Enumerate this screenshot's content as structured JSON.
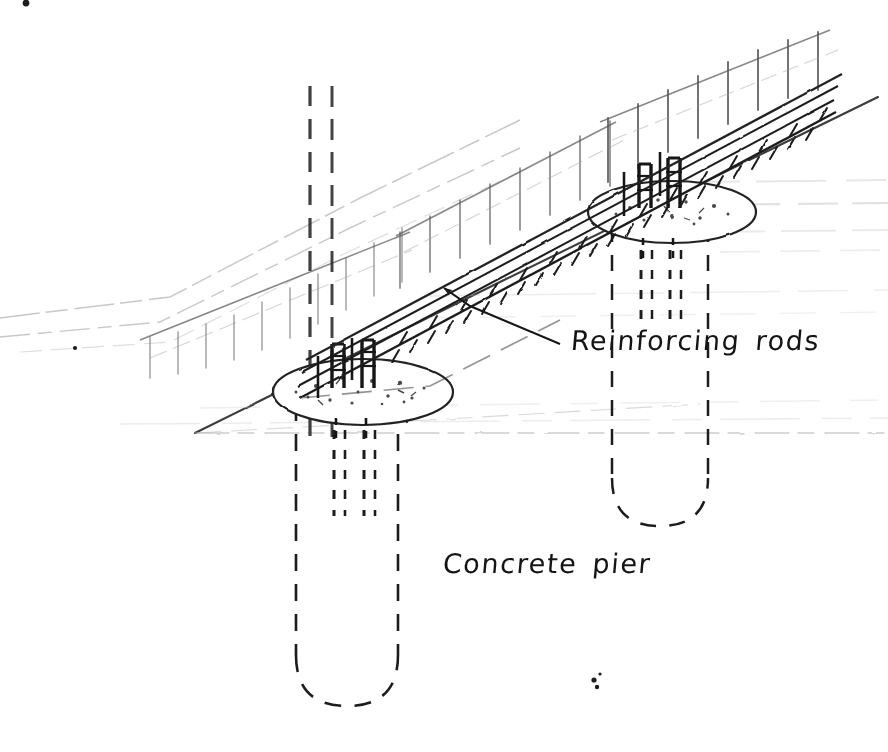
{
  "sheet": {
    "title": "Concrete pier foundation with reinforcing rods — hand drawn sketch",
    "width": 888,
    "height": 752,
    "background_color": "#ffffff",
    "ink_color": "#1a1a1a",
    "faded_ink_color": "#8f8f8f"
  },
  "annotations": {
    "reinforcing_rods": {
      "text": "Reinforcing rods",
      "leader": "line from label left edge up-left to beam, arrowhead at beam"
    },
    "concrete_pier": {
      "text": "Concrete pier",
      "leader": "horizontal dashed line from label left to pier wall, arrowhead at pier"
    }
  },
  "drawing": {
    "ground_plane": {
      "name": "sloping-ground-plane",
      "description": "wedge shaped ground surface rising to the upper right, drawn with faded double edge lines and hanging slope tick marks",
      "apex_point": [
        193,
        433
      ],
      "upper_edge_start": [
        193,
        433
      ],
      "upper_edge_end": [
        880,
        95
      ]
    },
    "slope_hatch": {
      "name": "slope-hatch-ticks",
      "description": "short vertical teeth hanging below each slope edge line",
      "rows": 3,
      "ticks_per_row": 12
    },
    "beam": {
      "name": "reinforced-concrete-beam",
      "description": "diagonal reinforced concrete grade beam spanning both piers",
      "start": [
        300,
        392
      ],
      "end": [
        830,
        108
      ],
      "band_count": 4,
      "hatched": true
    },
    "piers": [
      {
        "name": "left-concrete-pier",
        "cap_center": [
          363,
          392
        ],
        "cap_rx": 90,
        "cap_ry": 33,
        "shaft_top_y": 410,
        "shaft_bottom_y": 700,
        "shaft_half_width": 68,
        "hidden": true,
        "rod_count": 2
      },
      {
        "name": "right-concrete-pier",
        "cap_center": [
          672,
          212
        ],
        "cap_rx": 84,
        "cap_ry": 31,
        "shaft_top_y": 228,
        "shaft_bottom_y": 520,
        "shaft_half_width": 62,
        "hidden": true,
        "rod_count": 2
      }
    ],
    "rods": {
      "name": "reinforcing-rods",
      "description": "vertical steel rods running up out of each pier into the beam, shown dashed where hidden inside the pier",
      "left_pier_rod_x": [
        334,
        366
      ],
      "right_pier_rod_x": [
        641,
        672
      ],
      "count_total": 4
    },
    "hidden_verticals": {
      "name": "hidden-construction-lines",
      "description": "long dashed vertical construction lines running from the top of the sheet through the left pier",
      "x_positions": [
        310,
        330
      ]
    },
    "ink_specks": [
      {
        "x": 26,
        "y": 2,
        "r": 3
      },
      {
        "x": 75,
        "y": 348,
        "r": 2
      },
      {
        "x": 595,
        "y": 683,
        "r": 3
      }
    ]
  }
}
